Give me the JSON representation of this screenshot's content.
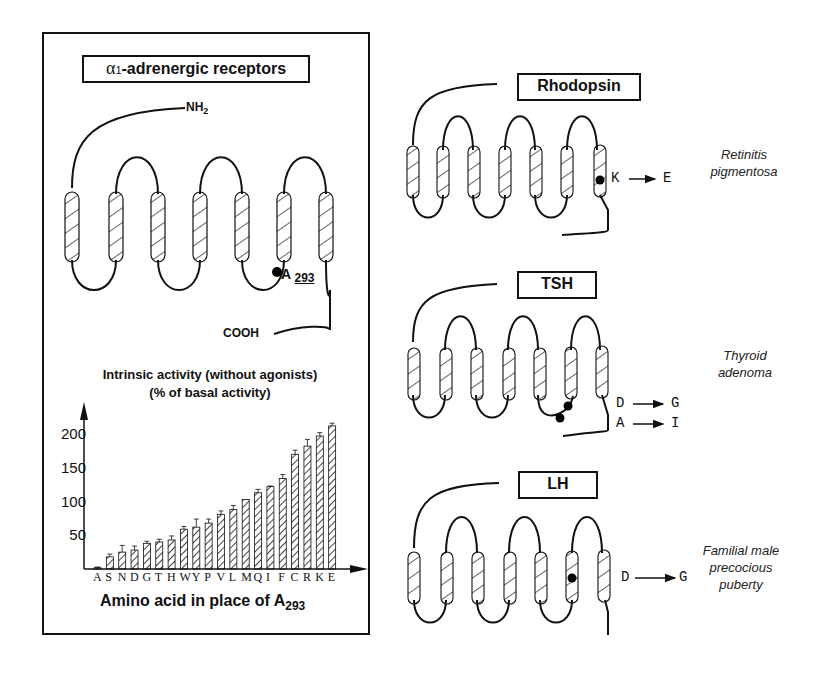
{
  "panel_left": {
    "title_prefix": "α",
    "title_sub": "1",
    "title_rest": "-adrenergic receptors",
    "n_terminus": "NH",
    "n_terminus_sub": "2",
    "c_terminus": "COOH",
    "mutation_site_letter": "A",
    "mutation_site_number": "293"
  },
  "receptors": [
    {
      "name": "Rhodopsin",
      "mutations": [
        "K → E"
      ],
      "disease_lines": [
        "Retinitis",
        "pigmentosa"
      ]
    },
    {
      "name": "TSH",
      "mutations": [
        "D → G",
        "A → I"
      ],
      "disease_lines": [
        "Thyroid",
        "adenoma"
      ]
    },
    {
      "name": "LH",
      "mutations": [
        "D → G"
      ],
      "disease_lines": [
        "Familial male",
        "precocious",
        "puberty"
      ]
    }
  ],
  "mutation_labels": {
    "rhodopsin_from": "K",
    "rhodopsin_to": "E",
    "tsh1_from": "D",
    "tsh1_to": "G",
    "tsh2_from": "A",
    "tsh2_to": "I",
    "lh_from": "D",
    "lh_to": "G"
  },
  "chart_data": {
    "type": "bar",
    "title": "Intrinsic activity (without agonists)",
    "subtitle": "(% of basal activity)",
    "xlabel": "Amino acid in place of A293",
    "xlabel_main": "Amino acid in place of A",
    "xlabel_sub": "293",
    "ylabel": "% of basal activity",
    "categories": [
      "A",
      "S",
      "N",
      "D",
      "G",
      "T",
      "H",
      "W",
      "Y",
      "P",
      "V",
      "L",
      "M",
      "Q",
      "I",
      "F",
      "C",
      "R",
      "K",
      "E"
    ],
    "category_string": "ASNDGTHWYPVLMQIFCRKE",
    "values": [
      2,
      18,
      25,
      28,
      38,
      40,
      43,
      59,
      62,
      68,
      81,
      88,
      103,
      113,
      122,
      134,
      170,
      182,
      197,
      212
    ],
    "error_bars": [
      1,
      4,
      10,
      6,
      3,
      4,
      6,
      4,
      12,
      6,
      5,
      6,
      0,
      5,
      1,
      6,
      6,
      10,
      5,
      4
    ],
    "yticks": [
      50,
      100,
      150,
      200
    ],
    "ylim": [
      0,
      230
    ],
    "grid": false,
    "bar_fill": "diagonal-hatch"
  }
}
